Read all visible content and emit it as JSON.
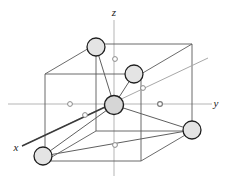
{
  "figure": {
    "type": "crystal-unit-cell-diagram",
    "width": 234,
    "height": 183,
    "background_color": "#ffffff"
  },
  "colors": {
    "cube_edge": "#4a4a4a",
    "cube_edge_light": "#8c8c8c",
    "axis": "#b0b0b0",
    "axis_label": "#1a1a1a",
    "bond": "#555555",
    "atom_fill": "#e2e2e2",
    "atom_stroke": "#1f1f1f",
    "small_marker": "#8a8a8a",
    "diagonal_ray": "#9a9a9a"
  },
  "axes": [
    {
      "name": "z",
      "label": "z",
      "label_x": 114,
      "label_y": 14,
      "direction": "up"
    },
    {
      "name": "y",
      "label": "y",
      "label_x": 218,
      "label_y": 104,
      "direction": "right"
    },
    {
      "name": "x",
      "label": "x",
      "label_x": 16,
      "label_y": 150,
      "direction": "lower-left"
    }
  ],
  "axis_lines": [
    {
      "name": "z-axis",
      "x1": 114,
      "y1": 20,
      "x2": 114,
      "y2": 176
    },
    {
      "name": "y-axis",
      "x1": 8,
      "y1": 104,
      "x2": 212,
      "y2": 104
    },
    {
      "name": "x-axis",
      "x1": 22,
      "y1": 146,
      "x2": 208,
      "y2": 58
    }
  ],
  "cube": {
    "name": "unit-cell-cube",
    "front_face": [
      {
        "x": 45,
        "y": 74
      },
      {
        "x": 141,
        "y": 74
      },
      {
        "x": 141,
        "y": 161
      },
      {
        "x": 45,
        "y": 161
      }
    ],
    "back_face": [
      {
        "x": 96,
        "y": 44
      },
      {
        "x": 192,
        "y": 44
      },
      {
        "x": 192,
        "y": 131
      },
      {
        "x": 96,
        "y": 131
      }
    ]
  },
  "atoms": [
    {
      "id": "atom-top-back-left",
      "label": "",
      "cx": 96,
      "cy": 47,
      "r": 9,
      "size": "large"
    },
    {
      "id": "atom-upper-right",
      "label": "",
      "cx": 134,
      "cy": 74,
      "r": 9,
      "size": "large"
    },
    {
      "id": "atom-center",
      "label": "",
      "cx": 114,
      "cy": 105,
      "r": 9.5,
      "size": "large"
    },
    {
      "id": "atom-lower-left",
      "label": "",
      "cx": 43,
      "cy": 156,
      "r": 9,
      "size": "large"
    },
    {
      "id": "atom-right",
      "label": "",
      "cx": 192,
      "cy": 130,
      "r": 9,
      "size": "large"
    }
  ],
  "small_markers": [
    {
      "id": "marker-top",
      "cx": 115,
      "cy": 59,
      "r": 2.4
    },
    {
      "id": "marker-left",
      "cx": 70,
      "cy": 104,
      "r": 2.4
    },
    {
      "id": "marker-left-lower",
      "cx": 85,
      "cy": 115,
      "r": 2.4
    },
    {
      "id": "marker-upper-right",
      "cx": 143,
      "cy": 88,
      "r": 2.4
    },
    {
      "id": "marker-right",
      "cx": 160,
      "cy": 104,
      "r": 2.4
    },
    {
      "id": "marker-bottom",
      "cx": 115,
      "cy": 145,
      "r": 2.4
    }
  ],
  "bonds": [
    {
      "id": "bond-center-topbackleft",
      "x1": 114,
      "y1": 105,
      "x2": 96,
      "y2": 47
    },
    {
      "id": "bond-center-upperright",
      "x1": 114,
      "y1": 105,
      "x2": 134,
      "y2": 74
    },
    {
      "id": "bond-center-lowerleft",
      "x1": 114,
      "y1": 105,
      "x2": 43,
      "y2": 156
    },
    {
      "id": "bond-center-right",
      "x1": 114,
      "y1": 105,
      "x2": 192,
      "y2": 130
    },
    {
      "id": "bond-lowerleft-right",
      "x1": 43,
      "y1": 156,
      "x2": 192,
      "y2": 130
    }
  ],
  "diagonal_ray": {
    "id": "x-axis-ray",
    "x1": 22,
    "y1": 146,
    "x2": 208,
    "y2": 58
  }
}
